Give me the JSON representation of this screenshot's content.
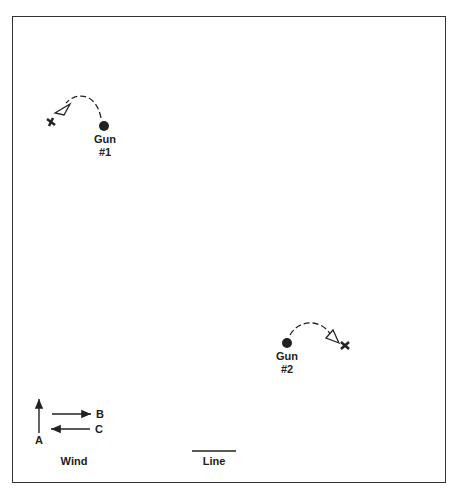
{
  "diagram": {
    "guns": [
      {
        "label": "Gun",
        "number": "#1"
      },
      {
        "label": "Gun",
        "number": "#2"
      }
    ],
    "legend": {
      "wind_label": "Wind",
      "line_label": "Line",
      "arrows": [
        "A",
        "B",
        "C"
      ]
    },
    "colors": {
      "ink": "#222222",
      "background": "#ffffff"
    }
  }
}
